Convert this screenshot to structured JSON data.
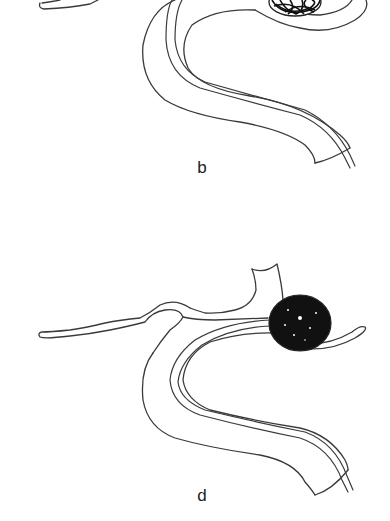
{
  "figure": {
    "panels": [
      {
        "id": "b",
        "label": "b",
        "aneurysm_state": "partially coiled (coil loops visible)",
        "visible_region": "lower portion only (top cropped)"
      },
      {
        "id": "d",
        "label": "d",
        "aneurysm_state": "densely packed coil mass (solid black)",
        "visible_region": "full"
      }
    ],
    "colors": {
      "background": "#ffffff",
      "outline": "#3a3a3a",
      "coil": "#111111",
      "label": "#222222"
    }
  }
}
